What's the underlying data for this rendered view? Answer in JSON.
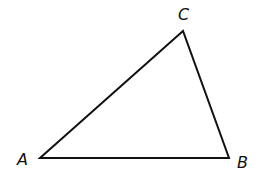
{
  "diagram": {
    "type": "triangle",
    "stroke_color": "#111111",
    "stroke_width": 2,
    "vertices": {
      "A": {
        "x": 40,
        "y": 158
      },
      "B": {
        "x": 229,
        "y": 158
      },
      "C": {
        "x": 183,
        "y": 31
      }
    },
    "labels": {
      "A": {
        "text": "A",
        "x": 17,
        "y": 165
      },
      "B": {
        "text": "B",
        "x": 237,
        "y": 168
      },
      "C": {
        "text": "C",
        "x": 178,
        "y": 20
      }
    }
  }
}
